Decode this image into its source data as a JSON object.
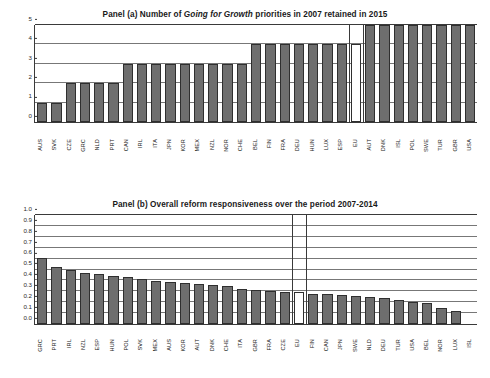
{
  "figure": {
    "panels": [
      {
        "id": "panel-a",
        "title_prefix": "Panel (a) Number of ",
        "title_italic": "Going for Growth",
        "title_suffix": " priorities in 2007 retained in 2015"
      },
      {
        "id": "panel-b",
        "title": "Panel (b) Overall reform responsiveness over the period 2007-2014"
      }
    ]
  },
  "chart_data": [
    {
      "type": "bar",
      "title": "Panel (a) Number of Going for Growth priorities in 2007 retained in 2015",
      "xlabel": "",
      "ylabel": "",
      "ylim": [
        0,
        5
      ],
      "yticks": [
        "0",
        "1",
        "2",
        "3",
        "4",
        "5"
      ],
      "grid": true,
      "legend": false,
      "reference_category": "EU",
      "categories": [
        "AUS",
        "SVK",
        "CZE",
        "GRC",
        "NLD",
        "PRT",
        "CAN",
        "IRL",
        "ITA",
        "JPN",
        "KOR",
        "MEX",
        "NZL",
        "NOR",
        "CHE",
        "BEL",
        "FIN",
        "FRA",
        "DEU",
        "HUN",
        "LUX",
        "ESP",
        "EU",
        "AUT",
        "DNK",
        "ISL",
        "POL",
        "SWE",
        "TUR",
        "GBR",
        "USA"
      ],
      "values": [
        1,
        1,
        2,
        2,
        2,
        2,
        3,
        3,
        3,
        3,
        3,
        3,
        3,
        3,
        3,
        4,
        4,
        4,
        4,
        4,
        4,
        4,
        4,
        5,
        5,
        5,
        5,
        5,
        5,
        5,
        5
      ]
    },
    {
      "type": "bar",
      "title": "Panel (b) Overall reform responsiveness over the period 2007-2014",
      "xlabel": "",
      "ylabel": "",
      "ylim": [
        0,
        1
      ],
      "yticks": [
        "0.0",
        "0.1",
        "0.2",
        "0.3",
        "0.4",
        "0.5",
        "0.6",
        "0.7",
        "0.8",
        "0.9",
        "1.0"
      ],
      "grid": true,
      "legend": false,
      "reference_category": "EU",
      "categories": [
        "GRC",
        "PRT",
        "IRL",
        "NZL",
        "ESP",
        "HUN",
        "POL",
        "SVK",
        "MEX",
        "AUS",
        "KOR",
        "AUT",
        "DNK",
        "CHE",
        "ITA",
        "GBR",
        "FRA",
        "CZE",
        "EU",
        "FIN",
        "CAN",
        "JPN",
        "SWE",
        "NLD",
        "DEU",
        "TUR",
        "USA",
        "BEL",
        "NOR",
        "LUX",
        "ISL"
      ],
      "values": [
        0.61,
        0.525,
        0.5,
        0.465,
        0.455,
        0.44,
        0.43,
        0.415,
        0.395,
        0.385,
        0.375,
        0.37,
        0.36,
        0.35,
        0.32,
        0.31,
        0.305,
        0.29,
        0.295,
        0.28,
        0.275,
        0.265,
        0.26,
        0.25,
        0.24,
        0.225,
        0.2,
        0.19,
        0.15,
        0.12,
        0.0
      ]
    }
  ]
}
